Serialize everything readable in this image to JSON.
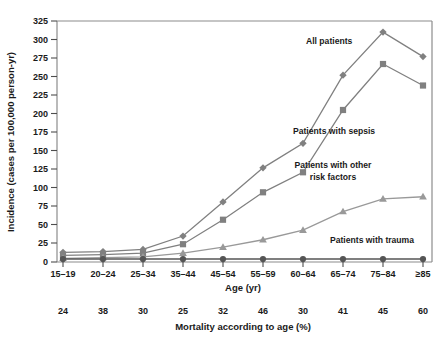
{
  "chart_data": {
    "type": "line",
    "title": "",
    "xlabel": "Age (yr)",
    "ylabel": "Incidence (cases per 100,000 person-yr)",
    "categories": [
      "15–19",
      "20–24",
      "25–34",
      "35–44",
      "45–54",
      "55–59",
      "60–64",
      "65–74",
      "75–84",
      "≥85"
    ],
    "ylim": [
      0,
      325
    ],
    "yticks": [
      0,
      25,
      50,
      75,
      100,
      125,
      150,
      175,
      200,
      225,
      250,
      275,
      300,
      325
    ],
    "grid": false,
    "legend_position": "inline-annotations",
    "series": [
      {
        "name": "All patients",
        "marker": "diamond",
        "color": "#808080",
        "values": [
          13,
          14,
          17,
          35,
          81,
          127,
          160,
          252,
          310,
          277
        ]
      },
      {
        "name": "Patients with sepsis",
        "marker": "square",
        "color": "#808080",
        "values": [
          9,
          10,
          12,
          24,
          57,
          94,
          121,
          205,
          267,
          238
        ]
      },
      {
        "name": "Patients with other risk factors",
        "marker": "triangle",
        "color": "#999999",
        "values": [
          5,
          6,
          7,
          12,
          20,
          30,
          43,
          68,
          85,
          88
        ]
      },
      {
        "name": "Patients with trauma",
        "marker": "circle",
        "color": "#555555",
        "values": [
          4,
          4,
          4,
          4,
          4,
          4,
          4,
          4,
          4,
          4
        ]
      }
    ],
    "secondary_axis": {
      "label": "Mortality according to age (%)",
      "values": [
        24,
        38,
        30,
        25,
        32,
        46,
        30,
        41,
        45,
        60
      ]
    }
  }
}
